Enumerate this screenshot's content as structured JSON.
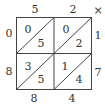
{
  "diagram": {
    "type": "lattice-multiplication",
    "operator": "×",
    "top_digits": [
      "5",
      "2"
    ],
    "right_digits": [
      "1",
      "7"
    ],
    "cells": [
      [
        {
          "tens": "0",
          "ones": "5"
        },
        {
          "tens": "0",
          "ones": "2"
        }
      ],
      [
        {
          "tens": "3",
          "ones": "5"
        },
        {
          "tens": "1",
          "ones": "4"
        }
      ]
    ],
    "left_digits": [
      "0",
      "8"
    ],
    "bottom_digits": [
      "8",
      "4"
    ]
  }
}
